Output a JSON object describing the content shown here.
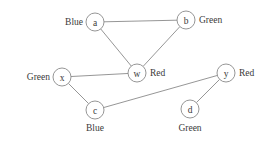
{
  "figure": {
    "width": 275,
    "height": 146,
    "background": "#ffffff",
    "stroke_color": "#8a8a8a",
    "text_color": "#3a3a3a"
  },
  "graph": {
    "node_radius": 9,
    "nodes": [
      {
        "id": "a",
        "letter": "a",
        "x": 95,
        "y": 22,
        "color_label": "Blue",
        "label_x": 83,
        "label_y": 22,
        "label_anchor": "end"
      },
      {
        "id": "b",
        "letter": "b",
        "x": 186,
        "y": 20,
        "color_label": "Green",
        "label_x": 199,
        "label_y": 20,
        "label_anchor": "start"
      },
      {
        "id": "w",
        "letter": "w",
        "x": 137,
        "y": 73,
        "color_label": "Red",
        "label_x": 150,
        "label_y": 73,
        "label_anchor": "start"
      },
      {
        "id": "x",
        "letter": "x",
        "x": 62,
        "y": 77,
        "color_label": "Green",
        "label_x": 50,
        "label_y": 77,
        "label_anchor": "end"
      },
      {
        "id": "y",
        "letter": "y",
        "x": 226,
        "y": 73,
        "color_label": "Red",
        "label_x": 239,
        "label_y": 73,
        "label_anchor": "start"
      },
      {
        "id": "c",
        "letter": "c",
        "x": 95,
        "y": 110,
        "color_label": "Blue",
        "label_x": 95,
        "label_y": 128,
        "label_anchor": "middle"
      },
      {
        "id": "d",
        "letter": "d",
        "x": 190,
        "y": 109,
        "color_label": "Green",
        "label_x": 190,
        "label_y": 128,
        "label_anchor": "middle"
      }
    ],
    "edges": [
      {
        "from": "a",
        "to": "b"
      },
      {
        "from": "a",
        "to": "w"
      },
      {
        "from": "b",
        "to": "w"
      },
      {
        "from": "x",
        "to": "w"
      },
      {
        "from": "x",
        "to": "c"
      },
      {
        "from": "c",
        "to": "y"
      },
      {
        "from": "d",
        "to": "y"
      }
    ]
  }
}
